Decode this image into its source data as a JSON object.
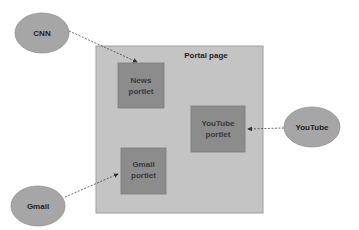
{
  "diagram": {
    "container": {
      "label": "Portal page",
      "fill": "#c4c4c4",
      "stroke": "#9a9a9a"
    },
    "portlets": [
      {
        "id": "news",
        "line1": "News",
        "line2": "portlet",
        "fill": "#8c8c8c"
      },
      {
        "id": "youtube",
        "line1": "YouTube",
        "line2": "portlet",
        "fill": "#8c8c8c"
      },
      {
        "id": "gmail",
        "line1": "Gmail",
        "line2": "portlet",
        "fill": "#8c8c8c"
      }
    ],
    "sources": [
      {
        "id": "cnn",
        "label": "CNN",
        "fill": "#a6a6a6",
        "target": "news"
      },
      {
        "id": "youtube",
        "label": "YouTube",
        "fill": "#a6a6a6",
        "target": "youtube"
      },
      {
        "id": "gmail",
        "label": "Gmail",
        "fill": "#a6a6a6",
        "target": "gmail"
      }
    ],
    "edge_style": "dashed-arrow",
    "edge_color": "#444444"
  }
}
